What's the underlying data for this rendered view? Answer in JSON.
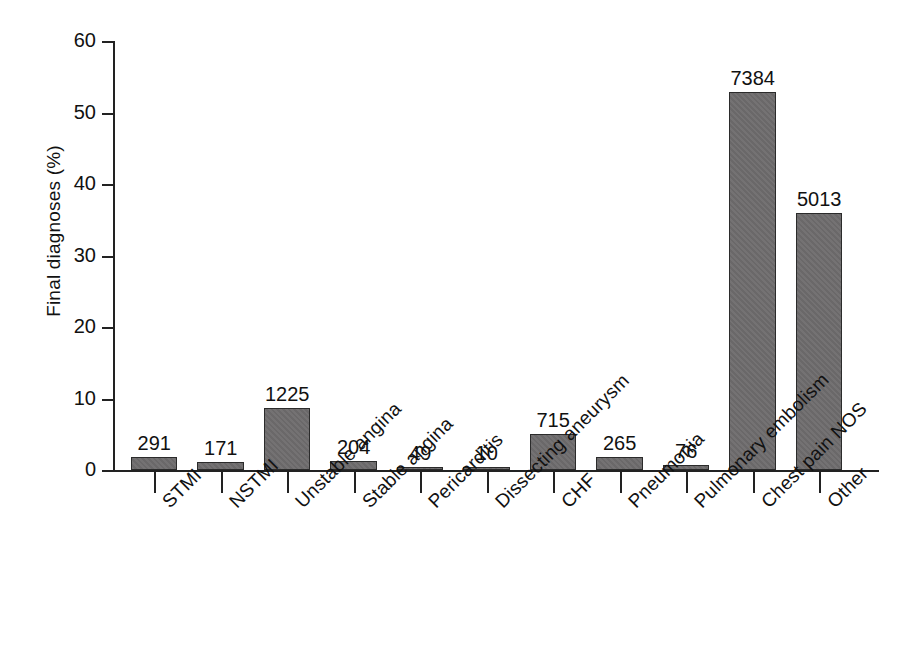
{
  "chart_data": {
    "type": "bar",
    "title": "",
    "xlabel": "",
    "ylabel": "Final diagnoses (%)",
    "ylim": [
      0,
      60
    ],
    "yticks": [
      0,
      10,
      20,
      30,
      40,
      50,
      60
    ],
    "ytick_labels": [
      "0",
      "10",
      "20",
      "30",
      "40",
      "50",
      "60"
    ],
    "grid": false,
    "legend": "none",
    "bar_color": "#6e6c6d",
    "bar_edge_color": "#2b2b2b",
    "categories": [
      "STMI",
      "NSTMI",
      "Unstable angina",
      "Stable angina",
      "Pericarditis",
      "Dissecting aneurysm",
      "CHF",
      "Pneumonia",
      "Pulmonary embolism",
      "Chest pain NOS",
      "Other"
    ],
    "values": [
      1.8,
      1.1,
      8.7,
      1.2,
      0.35,
      0.25,
      5.1,
      1.8,
      0.7,
      52.9,
      35.9
    ],
    "data_labels": [
      "291",
      "171",
      "1225",
      "204",
      "49",
      "10",
      "715",
      "265",
      "76",
      "7384",
      "5013"
    ],
    "counts": [
      291,
      171,
      1225,
      204,
      49,
      10,
      715,
      265,
      76,
      7384,
      5013
    ],
    "bars": [
      {
        "category": "STMI",
        "count": 291,
        "label": "291",
        "percent": 1.8
      },
      {
        "category": "NSTMI",
        "count": 171,
        "label": "171",
        "percent": 1.1
      },
      {
        "category": "Unstable angina",
        "count": 1225,
        "label": "1225",
        "percent": 8.7
      },
      {
        "category": "Stable angina",
        "count": 204,
        "label": "204",
        "percent": 1.2
      },
      {
        "category": "Pericarditis",
        "count": 49,
        "label": "49",
        "percent": 0.35
      },
      {
        "category": "Dissecting aneurysm",
        "count": 10,
        "label": "10",
        "percent": 0.25
      },
      {
        "category": "CHF",
        "count": 715,
        "label": "715",
        "percent": 5.1
      },
      {
        "category": "Pneumonia",
        "count": 265,
        "label": "265",
        "percent": 1.8
      },
      {
        "category": "Pulmonary embolism",
        "count": 76,
        "label": "76",
        "percent": 0.7
      },
      {
        "category": "Chest pain NOS",
        "count": 7384,
        "label": "7384",
        "percent": 52.9
      },
      {
        "category": "Other",
        "count": 5013,
        "label": "5013",
        "percent": 35.9
      }
    ]
  }
}
